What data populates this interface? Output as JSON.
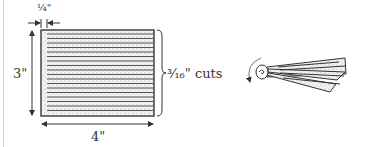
{
  "figure": {
    "left_diagram": {
      "margin_label": "¼\"",
      "height_label": "3\"",
      "width_label": "4\"",
      "cuts_label": "³⁄₁₆\" cuts",
      "cut_line_count": 18
    },
    "right_diagram": {
      "description": "rolled fringe strip with rotation arrow"
    },
    "colors": {
      "stroke": "#333333",
      "fill_stipple": "#e6e6e6",
      "frame": "#cfcfcf"
    }
  }
}
